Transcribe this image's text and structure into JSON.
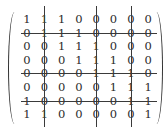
{
  "matrix": {
    "rows": [
      [
        1,
        1,
        1,
        0,
        0,
        0,
        0,
        0
      ],
      [
        0,
        1,
        1,
        1,
        0,
        0,
        0,
        0
      ],
      [
        0,
        0,
        1,
        1,
        1,
        0,
        0,
        0
      ],
      [
        0,
        0,
        0,
        1,
        1,
        1,
        0,
        0
      ],
      [
        0,
        0,
        0,
        0,
        1,
        1,
        1,
        0
      ],
      [
        0,
        0,
        0,
        0,
        0,
        1,
        1,
        1
      ],
      [
        1,
        0,
        0,
        0,
        0,
        0,
        1,
        1
      ],
      [
        1,
        1,
        0,
        0,
        0,
        0,
        0,
        1
      ]
    ],
    "struck_rows": [
      1,
      4,
      6
    ],
    "struck_columns": [
      1,
      4,
      6
    ]
  }
}
